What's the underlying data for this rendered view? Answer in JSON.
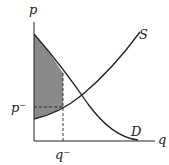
{
  "diagram": {
    "labels": {
      "y_axis": "p",
      "x_axis": "q",
      "supply": "S",
      "demand": "D",
      "p_bar": "p⁻",
      "q_bar": "q⁻"
    },
    "colors": {
      "curve": "#222222",
      "shaded": "#8a8a8a",
      "background": "#ffffff"
    }
  }
}
